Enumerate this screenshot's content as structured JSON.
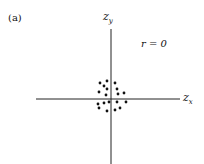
{
  "panel_label": "(a)",
  "annotation": "r = 0",
  "axes": {
    "x_label_main": "z",
    "x_label_sub": "x",
    "y_label_main": "z",
    "y_label_sub": "y"
  },
  "chart_data": {
    "type": "scatter",
    "title": "(a)",
    "annotation": "r = 0",
    "xlabel": "z_x",
    "ylabel": "z_y",
    "grid": false,
    "legend": null,
    "points_pixel_coords_note": "approximate positions relative to axis origin (pixels, y up)",
    "points": [
      {
        "x": -11,
        "y": 16
      },
      {
        "x": -4,
        "y": 18
      },
      {
        "x": 4,
        "y": 16
      },
      {
        "x": -7,
        "y": 13
      },
      {
        "x": -4,
        "y": 10
      },
      {
        "x": 6,
        "y": 10
      },
      {
        "x": -12,
        "y": 7
      },
      {
        "x": -5,
        "y": 4
      },
      {
        "x": 7,
        "y": 5
      },
      {
        "x": 13,
        "y": 6
      },
      {
        "x": -13,
        "y": -5
      },
      {
        "x": -7,
        "y": -4
      },
      {
        "x": -2,
        "y": -3
      },
      {
        "x": 6,
        "y": -3
      },
      {
        "x": 15,
        "y": -3
      },
      {
        "x": -12,
        "y": -9
      },
      {
        "x": -4,
        "y": -12
      },
      {
        "x": 4,
        "y": -11
      },
      {
        "x": 9,
        "y": -9
      }
    ]
  }
}
